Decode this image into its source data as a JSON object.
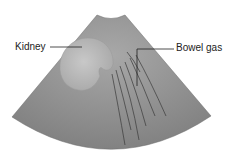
{
  "diagram": {
    "type": "ultrasound-sector-schematic",
    "labels": {
      "kidney": "Kidney",
      "bowel_gas": "Bowel gas"
    },
    "colors": {
      "background": "#ffffff",
      "sector_fill": "#8a8a8a",
      "sector_light": "#a6a6a6",
      "kidney_fill": "#bdbdbd",
      "artifact_lines": "#3a3a3a",
      "leader_lines": "#222222"
    }
  }
}
